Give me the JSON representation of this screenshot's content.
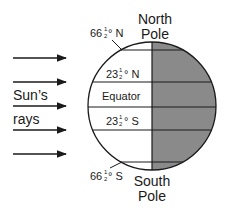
{
  "diagram": {
    "title_top": {
      "line1": "North",
      "line2": "Pole"
    },
    "title_bottom": {
      "line1": "South",
      "line2": "Pole"
    },
    "sun_label": {
      "line1": "Sun’s",
      "line2": "rays"
    },
    "latitudes": [
      {
        "id": "arctic-circle",
        "whole": "66",
        "frac_num": "1",
        "frac_den": "2",
        "suffix": "° N"
      },
      {
        "id": "tropic-cancer",
        "whole": "23",
        "frac_num": "1",
        "frac_den": "2",
        "suffix": "° N"
      },
      {
        "id": "equator",
        "label": "Equator"
      },
      {
        "id": "tropic-capricorn",
        "whole": "23",
        "frac_num": "1",
        "frac_den": "2",
        "suffix": "° S"
      },
      {
        "id": "antarctic-circle",
        "whole": "66",
        "frac_num": "1",
        "frac_den": "2",
        "suffix": "° S"
      }
    ],
    "ray_count": 5,
    "colors": {
      "night_side": "#8a8a8a",
      "day_side": "#ffffff",
      "line": "#1a1a1a"
    }
  }
}
